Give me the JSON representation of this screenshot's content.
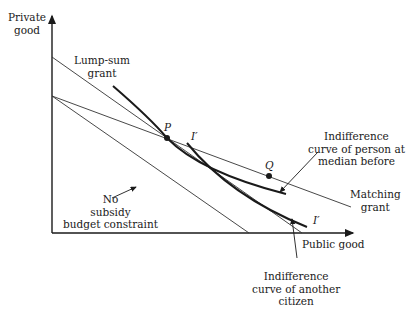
{
  "diagram": {
    "axes": {
      "y_label_line1": "Private",
      "y_label_line2": "good",
      "x_label": "Public good"
    },
    "lines": {
      "lump_sum_line1": "Lump-sum",
      "lump_sum_line2": "grant",
      "matching_line1": "Matching",
      "matching_line2": "grant",
      "no_subsidy_line1": "No",
      "no_subsidy_line2": "subsidy",
      "no_subsidy_line3": "budget constraint"
    },
    "curves": {
      "median_line1": "Indifference",
      "median_line2": "curve of person at",
      "median_line3": "median before",
      "another_line1": "Indifference",
      "another_line2": "curve of another",
      "another_line3": "citizen",
      "i_prime_top": "I′",
      "i_prime_bottom": "I′"
    },
    "points": {
      "p": "P",
      "q": "Q"
    },
    "colors": {
      "ink": "#1a1a1a"
    }
  }
}
